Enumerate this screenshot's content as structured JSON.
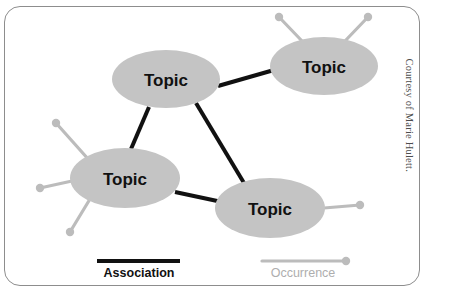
{
  "figure": {
    "type": "topic-map-diagram",
    "credit": "Courtesy of Marie Hulett.",
    "background_color": "#ffffff",
    "card_border_color": "#8d8d8d"
  },
  "colors": {
    "topic_fill": "#c4c4c4",
    "topic_text": "#111111",
    "association_line": "#111111",
    "occurrence_line": "#bcbcbc",
    "occurrence_dot": "#bcbcbc",
    "legend_occurrence_text": "#aeaeae"
  },
  "nodes": [
    {
      "id": "topic-top-left",
      "label": "Topic",
      "cx": 166,
      "cy": 79,
      "rx": 54,
      "ry": 29
    },
    {
      "id": "topic-top-right",
      "label": "Topic",
      "cx": 324,
      "cy": 66,
      "rx": 54,
      "ry": 29
    },
    {
      "id": "topic-left",
      "label": "Topic",
      "cx": 125,
      "cy": 178,
      "rx": 55,
      "ry": 30
    },
    {
      "id": "topic-bottom",
      "label": "Topic",
      "cx": 270,
      "cy": 208,
      "rx": 55,
      "ry": 30
    }
  ],
  "associations": [
    {
      "id": "assoc-topleft-topright",
      "from": "topic-top-left",
      "to": "topic-top-right",
      "x1": 218,
      "y1": 86,
      "x2": 274,
      "y2": 70
    },
    {
      "id": "assoc-topleft-left",
      "from": "topic-top-left",
      "to": "topic-left",
      "x1": 149,
      "y1": 107,
      "x2": 131,
      "y2": 149
    },
    {
      "id": "assoc-topleft-bottom",
      "from": "topic-top-left",
      "to": "topic-bottom",
      "x1": 196,
      "y1": 103,
      "x2": 244,
      "y2": 183
    },
    {
      "id": "assoc-left-bottom",
      "from": "topic-left",
      "to": "topic-bottom",
      "x1": 175,
      "y1": 192,
      "x2": 222,
      "y2": 202
    }
  ],
  "occurrences": [
    {
      "id": "occ-top-right-a",
      "node": "topic-top-right",
      "x1": 302,
      "y1": 41,
      "x2": 279,
      "y2": 17
    },
    {
      "id": "occ-top-right-b",
      "node": "topic-top-right",
      "x1": 345,
      "y1": 41,
      "x2": 368,
      "y2": 17
    },
    {
      "id": "occ-left-upper",
      "node": "topic-left",
      "x1": 89,
      "y1": 160,
      "x2": 56,
      "y2": 123
    },
    {
      "id": "occ-left-middle",
      "node": "topic-left",
      "x1": 72,
      "y1": 181,
      "x2": 40,
      "y2": 188
    },
    {
      "id": "occ-left-lower",
      "node": "topic-left",
      "x1": 90,
      "y1": 199,
      "x2": 70,
      "y2": 232
    },
    {
      "id": "occ-bottom-right",
      "node": "topic-bottom",
      "x1": 324,
      "y1": 208,
      "x2": 360,
      "y2": 205
    }
  ],
  "legend": {
    "association": {
      "label": "Association",
      "line_x1": 97,
      "line_x2": 180,
      "line_y": 261,
      "text_x": 139,
      "text_y": 277
    },
    "occurrence": {
      "label": "Occurrence",
      "line_x1": 262,
      "line_x2": 344,
      "line_y": 261,
      "dot_x": 346,
      "dot_y": 261,
      "text_x": 303,
      "text_y": 277
    }
  }
}
